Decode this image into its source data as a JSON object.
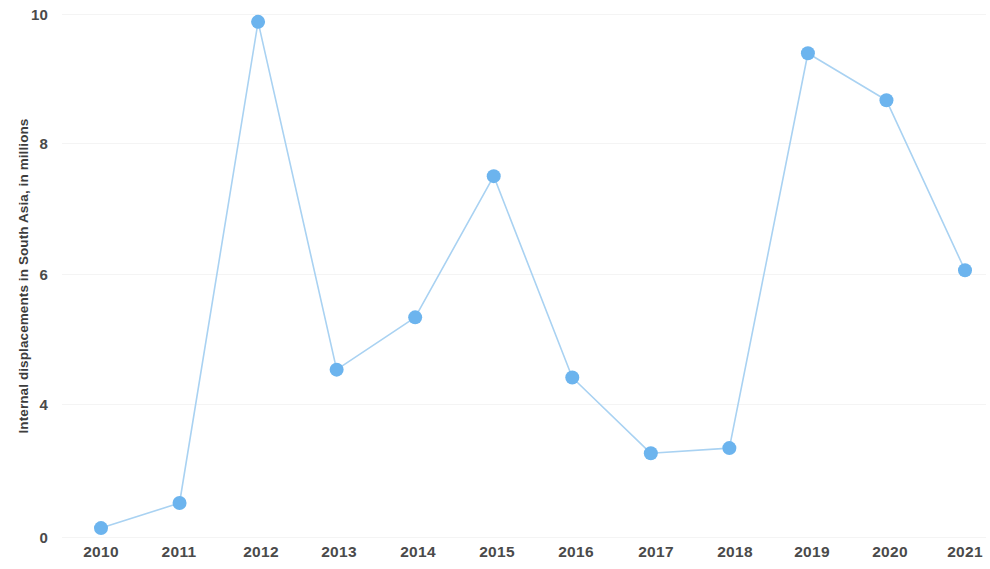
{
  "chart_data": {
    "type": "line",
    "title": "",
    "xlabel": "",
    "ylabel": "Internal displacements in South Asia, in millions",
    "categories": [
      "2010",
      "2011",
      "2012",
      "2013",
      "2014",
      "2015",
      "2016",
      "2017",
      "2018",
      "2019",
      "2020",
      "2021"
    ],
    "values": [
      0.17,
      0.65,
      9.85,
      3.2,
      4.2,
      6.9,
      3.05,
      1.6,
      1.7,
      9.25,
      8.35,
      5.1
    ],
    "series": [
      {
        "name": "Internal displacements in South Asia",
        "values": [
          0.17,
          0.65,
          9.85,
          3.2,
          4.2,
          6.9,
          3.05,
          1.6,
          1.7,
          9.25,
          8.35,
          5.1
        ]
      }
    ],
    "ylim": [
      0,
      10
    ],
    "y_ticks": [
      0,
      4,
      6,
      8,
      10
    ],
    "y_tick_labels": [
      "0",
      "4",
      "6",
      "8",
      "10"
    ],
    "grid": false,
    "legend": "none",
    "series_color": "#6cb4ee",
    "line_color": "#a9d2f2",
    "marker_color": "#6cb4ee",
    "axis_text_color": "#4a4a4a"
  },
  "axis": {
    "y_title": "Internal displacements in South Asia, in millions"
  }
}
